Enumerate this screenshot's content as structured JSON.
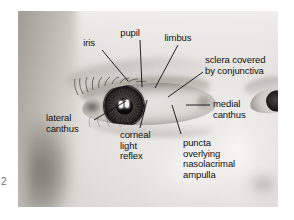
{
  "figure": {
    "number": "2",
    "caption_present": false,
    "photo": {
      "subject": "infant-eye-close-up",
      "description": "Grayscale clinical photograph of an infant's right eye in close-up, three-quarter view, showing external ocular anatomy"
    }
  },
  "annotations": [
    {
      "id": "iris",
      "label": "iris",
      "lines": [
        "iris"
      ],
      "align": "center",
      "label_x": 88,
      "label_y": 38,
      "leader": [
        [
          102,
          50
        ],
        [
          128,
          81
        ]
      ]
    },
    {
      "id": "pupil",
      "label": "pupil",
      "lines": [
        "pupil"
      ],
      "align": "center",
      "label_x": 129,
      "label_y": 28,
      "leader": [
        [
          140,
          40
        ],
        [
          142,
          87
        ]
      ]
    },
    {
      "id": "limbus",
      "label": "limbus",
      "lines": [
        "limbus"
      ],
      "align": "center",
      "label_x": 173,
      "label_y": 33,
      "leader": [
        [
          178,
          45
        ],
        [
          155,
          88
        ]
      ]
    },
    {
      "id": "sclera-covered-by-conjunctiva",
      "label": "sclera covered by conjunctiva",
      "lines": [
        "sclera covered",
        "by conjunctiva"
      ],
      "align": "left",
      "label_x": 205,
      "label_y": 55,
      "leader": [
        [
          203,
          72
        ],
        [
          168,
          97
        ]
      ]
    },
    {
      "id": "medial-canthus",
      "label": "medial canthus",
      "lines": [
        "medial",
        "canthus"
      ],
      "align": "left",
      "label_x": 213,
      "label_y": 99,
      "leader": [
        [
          210,
          105
        ],
        [
          186,
          105
        ]
      ]
    },
    {
      "id": "lateral-canthus",
      "label": "lateral canthus",
      "lines": [
        "lateral",
        "canthus"
      ],
      "align": "left",
      "label_x": 46,
      "label_y": 113,
      "leader": [
        [
          94,
          120
        ],
        [
          126,
          101
        ]
      ]
    },
    {
      "id": "corneal-light-reflex",
      "label": "corneal light reflex",
      "lines": [
        "corneal",
        "light",
        "reflex"
      ],
      "align": "left",
      "label_x": 120,
      "label_y": 130,
      "leader": [
        [
          140,
          128
        ],
        [
          147,
          100
        ]
      ]
    },
    {
      "id": "puncta-overlying-nasolacrimal-ampulla",
      "label": "puncta overlying nasolacrimal ampulla",
      "lines": [
        "puncta",
        "overlying",
        "nasolacrimal",
        "ampulla"
      ],
      "align": "left",
      "label_x": 183,
      "label_y": 138,
      "leader": [
        [
          181,
          134
        ],
        [
          172,
          105
        ]
      ]
    }
  ],
  "colors": {
    "background": "#ffffff",
    "ink": "#121212",
    "figure_number": "#6d6d6d",
    "photo_light": "#f2f1ef",
    "photo_mid": "#c6c2bd",
    "photo_dark": "#8e8a84",
    "iris_dark": "#2e2b28",
    "pupil": "#0d0c0c",
    "reflex": "#fbfbfa"
  }
}
